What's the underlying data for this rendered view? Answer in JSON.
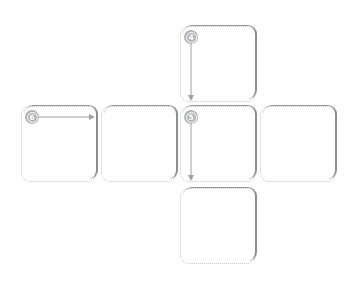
{
  "diagram": {
    "type": "cube-net",
    "colors": {
      "dotted_border": "#c4c4c4",
      "shadow_edge": "#8e8e8e",
      "badge": "#b5b5b5",
      "arrow": "#9a9a9a"
    },
    "faces": [
      {
        "id": "top",
        "label": "4",
        "arrow": "down"
      },
      {
        "id": "left",
        "label": "6",
        "arrow": "right"
      },
      {
        "id": "center-left",
        "label": "",
        "arrow": ""
      },
      {
        "id": "center",
        "label": "5",
        "arrow": "down"
      },
      {
        "id": "right",
        "label": "",
        "arrow": ""
      },
      {
        "id": "bottom",
        "label": "",
        "arrow": ""
      }
    ]
  }
}
